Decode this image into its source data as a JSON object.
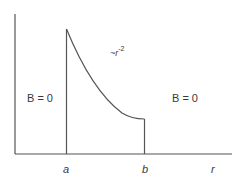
{
  "diagram": {
    "x_axis_label": "r",
    "ticks": [
      {
        "label": "a"
      },
      {
        "label": "b"
      }
    ],
    "region_left_label": "B = 0",
    "region_right_label": "B = 0",
    "curve_label_prefix": "~r",
    "curve_label_exponent": "-2",
    "colors": {
      "line": "#555555",
      "text": "#3a3a3a",
      "background": "#ffffff"
    }
  }
}
